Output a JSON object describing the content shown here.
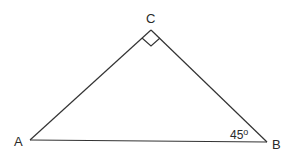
{
  "diagram": {
    "type": "right-triangle",
    "vertices": {
      "A": {
        "label": "A"
      },
      "B": {
        "label": "B"
      },
      "C": {
        "label": "C"
      }
    },
    "angles": {
      "C": {
        "value": "90°",
        "marker": "right-angle-square"
      },
      "B": {
        "label": "45o"
      }
    },
    "sides": [
      "AB",
      "BC",
      "CA"
    ],
    "colors": {
      "stroke": "#333333",
      "text": "#2a2a2a",
      "background": "#ffffff"
    }
  }
}
